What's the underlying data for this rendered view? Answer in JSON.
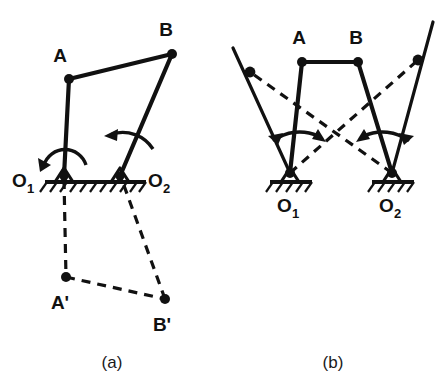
{
  "figure": {
    "captions": [
      {
        "id": "caption-a",
        "text": "(a)",
        "x": 112,
        "y": 368
      },
      {
        "id": "caption-b",
        "text": "(b)",
        "x": 333,
        "y": 368
      }
    ]
  },
  "diagram_a": {
    "name": "crank-rocker-linkage-a",
    "labels": {
      "point_a": "A",
      "point_b": "B",
      "point_a_prime": "A'",
      "point_b_prime": "B'",
      "pivot_1": "O",
      "pivot_1_sub": "1",
      "pivot_2": "O",
      "pivot_2_sub": "2"
    },
    "points": {
      "A": {
        "x": 69,
        "y": 79
      },
      "B": {
        "x": 172,
        "y": 54
      },
      "O1": {
        "x": 64,
        "y": 176
      },
      "O2": {
        "x": 120,
        "y": 176
      },
      "Ap": {
        "x": 66,
        "y": 277
      },
      "Bp": {
        "x": 165,
        "y": 299
      }
    },
    "label_positions": {
      "A": {
        "x": 60,
        "y": 62
      },
      "B": {
        "x": 163,
        "y": 36
      },
      "Ap": {
        "x": 55,
        "y": 309
      },
      "Bp": {
        "x": 154,
        "y": 331
      },
      "O1": {
        "x": 12,
        "y": 188
      },
      "O2": {
        "x": 144,
        "y": 188
      }
    },
    "ground": {
      "x1": 45,
      "x2": 146,
      "y": 182
    },
    "links_solid": [
      {
        "name": "crank-O1-A",
        "from": "O1",
        "to": "A"
      },
      {
        "name": "coupler-A-B",
        "from": "A",
        "to": "B"
      },
      {
        "name": "rocker-B-O2",
        "from": "B",
        "to": "O2"
      }
    ],
    "links_dashed": [
      {
        "name": "crank-O1-Aprime",
        "from": "O1",
        "to": "Ap"
      },
      {
        "name": "coupler-Aprime-Bprime",
        "from": "Ap",
        "to": "Bp"
      },
      {
        "name": "rocker-Bprime-O2",
        "from": "Bp",
        "to": "O2"
      }
    ],
    "motion_arrows": [
      {
        "name": "rotation-arrow-O1",
        "pivot": "O1",
        "radius": 26,
        "direction": "counterclockwise-sweep"
      },
      {
        "name": "rotation-arrow-O2",
        "pivot": "O2",
        "radius": 34,
        "direction": "leftward-sweep"
      }
    ]
  },
  "diagram_b": {
    "name": "crank-rocker-linkage-b",
    "labels": {
      "point_a": "A",
      "point_b": "B",
      "pivot_1": "O",
      "pivot_1_sub": "1",
      "pivot_2": "O",
      "pivot_2_sub": "2"
    },
    "points": {
      "A": {
        "x": 302,
        "y": 62
      },
      "B": {
        "x": 358,
        "y": 62
      },
      "O1": {
        "x": 290,
        "y": 173
      },
      "O2": {
        "x": 392,
        "y": 173
      },
      "L": {
        "x": 250,
        "y": 72
      },
      "R": {
        "x": 418,
        "y": 60
      }
    },
    "label_positions": {
      "A": {
        "x": 293,
        "y": 44
      },
      "B": {
        "x": 350,
        "y": 44
      },
      "O1": {
        "x": 276,
        "y": 210
      },
      "O2": {
        "x": 378,
        "y": 210
      }
    },
    "ground_left": {
      "x1": 272,
      "x2": 310,
      "y": 182
    },
    "ground_right": {
      "x1": 374,
      "x2": 412,
      "y": 182
    },
    "links_solid": [
      {
        "name": "crank-O1-A",
        "from": "O1",
        "to": "A"
      },
      {
        "name": "coupler-A-B",
        "from": "A",
        "to": "B"
      },
      {
        "name": "rocker-B-O2",
        "from": "B",
        "to": "O2"
      },
      {
        "name": "extension-O2-L",
        "from": "O2",
        "to": "L",
        "extend_to": {
          "x": 233,
          "y": 48
        }
      },
      {
        "name": "extension-O1-R",
        "from": "O1",
        "to": "R",
        "extend_to": {
          "x": 433,
          "y": 22
        }
      }
    ],
    "links_dashed": [
      {
        "name": "diagonal-O1-R",
        "from": "O1",
        "to": "R"
      },
      {
        "name": "diagonal-O2-L",
        "from": "O2",
        "to": "L"
      }
    ],
    "motion_arrows": [
      {
        "name": "rotation-arrow-O1",
        "pivot": "O1",
        "radius": 44,
        "direction": "double-headed-sweep"
      },
      {
        "name": "rotation-arrow-O2",
        "pivot": "O2",
        "radius": 44,
        "direction": "double-headed-sweep"
      }
    ]
  },
  "colors": {
    "ink": "#111111",
    "background": "#ffffff"
  }
}
